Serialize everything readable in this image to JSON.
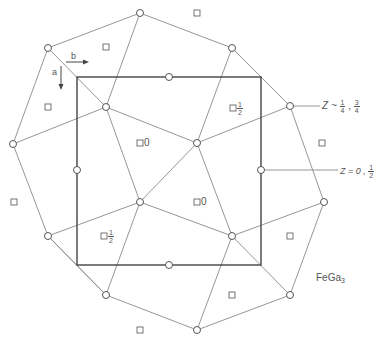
{
  "diagram": {
    "compound_label": "FeGa",
    "compound_subscript": "3",
    "axes": {
      "a_label": "a",
      "b_label": "b"
    },
    "z_labels": {
      "upper": {
        "prefix": "Z ~ ",
        "frac1_num": "1",
        "frac1_den": "4",
        "sep": " , ",
        "frac2_num": "3",
        "frac2_den": "4"
      },
      "lower": {
        "prefix": "Z = 0 , ",
        "frac_num": "1",
        "frac_den": "2"
      }
    },
    "site_labels": {
      "zero": "0",
      "half_num": "1",
      "half_den": "2"
    },
    "unit_cell": {
      "x": 77,
      "y": 77,
      "width": 184,
      "height": 188
    },
    "outer_vertices": [
      [
        140,
        13
      ],
      [
        232,
        48
      ],
      [
        290,
        106
      ],
      [
        324,
        202
      ],
      [
        290,
        295
      ],
      [
        197,
        330
      ],
      [
        106,
        295
      ],
      [
        48,
        236
      ],
      [
        13,
        144
      ],
      [
        48,
        48
      ]
    ],
    "inner_atoms": [
      [
        106,
        107
      ],
      [
        197,
        143
      ],
      [
        140,
        202
      ],
      [
        232,
        236
      ]
    ],
    "edge_midpoint_atoms": [
      [
        169,
        77
      ],
      [
        77,
        170
      ],
      [
        261,
        170
      ],
      [
        169,
        265
      ]
    ],
    "plain_squares": [
      [
        106,
        47
      ],
      [
        197,
        13
      ],
      [
        48,
        107
      ],
      [
        322,
        143
      ],
      [
        14,
        202
      ],
      [
        290,
        236
      ],
      [
        232,
        295
      ],
      [
        140,
        330
      ]
    ]
  }
}
